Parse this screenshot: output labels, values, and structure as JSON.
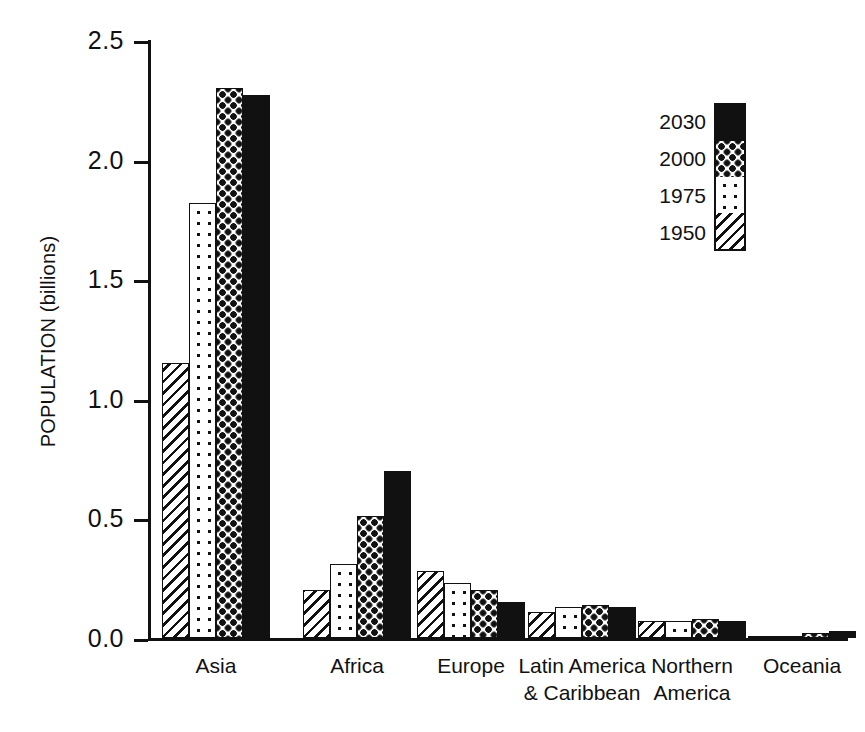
{
  "chart_data": {
    "type": "bar",
    "title": "",
    "xlabel": "",
    "ylabel": "POPULATION (billions)",
    "ylim": [
      0.0,
      2.5
    ],
    "yticks": [
      "0.0",
      "0.5",
      "1.0",
      "1.5",
      "2.0",
      "2.5"
    ],
    "ytick_values": [
      0.0,
      0.5,
      1.0,
      1.5,
      2.0,
      2.5
    ],
    "grid": false,
    "legend_position": "upper-right",
    "categories": [
      "Asia",
      "Africa",
      "Europe",
      "Latin America\n& Caribbean",
      "Northern\nAmerica",
      "Oceania"
    ],
    "series": [
      {
        "name": "1950",
        "pattern": "diagonal-hatch",
        "values": [
          1.15,
          0.2,
          0.28,
          0.11,
          0.07,
          0.01
        ]
      },
      {
        "name": "1975",
        "pattern": "sparse-dots",
        "values": [
          1.82,
          0.31,
          0.23,
          0.13,
          0.07,
          0.01
        ]
      },
      {
        "name": "2000",
        "pattern": "checkerboard",
        "values": [
          2.3,
          0.51,
          0.2,
          0.14,
          0.08,
          0.02
        ]
      },
      {
        "name": "2030",
        "pattern": "solid-black",
        "values": [
          2.27,
          0.7,
          0.15,
          0.13,
          0.07,
          0.03
        ]
      }
    ]
  },
  "legend": {
    "entries": [
      {
        "label": "2030",
        "pattern": "solid-black"
      },
      {
        "label": "2000",
        "pattern": "checkerboard"
      },
      {
        "label": "1975",
        "pattern": "sparse-dots"
      },
      {
        "label": "1950",
        "pattern": "diagonal-hatch"
      }
    ]
  },
  "colors": {
    "ink": "#111111",
    "background": "#ffffff"
  }
}
